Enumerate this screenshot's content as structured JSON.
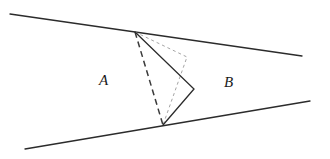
{
  "figure": {
    "width": 330,
    "height": 159,
    "background_color": "#ffffff",
    "stroke_color": "#2b2b2b",
    "dashed_stroke_color": "#3a3a3a",
    "dotted_stroke_color": "#9a9a9a",
    "labels": {
      "region_a": "A",
      "region_b": "B"
    },
    "boundary_lines": [
      {
        "name": "upper-wedge-line",
        "x1": 10,
        "y1": 14,
        "x2": 302,
        "y2": 56,
        "style": "solid",
        "stroke_width": 1.3
      },
      {
        "name": "lower-wedge-line",
        "x1": 25,
        "y1": 149,
        "x2": 310,
        "y2": 101,
        "style": "solid",
        "stroke_width": 1.3
      }
    ],
    "vertices": {
      "apex": {
        "x": 135,
        "y": 32
      },
      "right": {
        "x": 194,
        "y": 89
      },
      "bottom": {
        "x": 163,
        "y": 125
      },
      "inner_right": {
        "x": 187,
        "y": 57
      }
    },
    "solid_chevron": {
      "name": "solid-chevron-path",
      "points": "135,32 194,89 163,125",
      "style": "solid",
      "stroke_width": 1.3,
      "closed": false
    },
    "dashed_chord": {
      "name": "dashed-chord-apex-to-bottom",
      "x1": 135,
      "y1": 32,
      "x2": 163,
      "y2": 125,
      "style": "dashed",
      "dash_pattern": "6,4",
      "stroke_width": 1.5
    },
    "dotted_triangle": {
      "name": "dotted-inner-triangle",
      "points": "135,32 187,57 163,125",
      "style": "dotted",
      "dash_pattern": "3,3",
      "stroke_width": 0.9,
      "closed": false
    }
  }
}
